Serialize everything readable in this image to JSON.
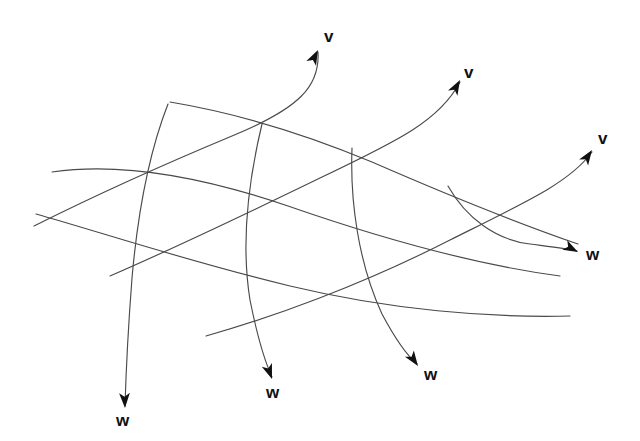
{
  "figure": {
    "width": 640,
    "height": 441,
    "background_color": "#ffffff",
    "line_color": "#4a4a4a",
    "arrow_color": "#111111",
    "label_color": "#111111"
  },
  "labels": {
    "v1": "v",
    "v2": "v",
    "v3": "v",
    "w1": "w",
    "w2": "w",
    "w3": "w",
    "w4": "w"
  },
  "label_positions": [
    {
      "text": "v",
      "x": 324,
      "y": 28
    },
    {
      "text": "v",
      "x": 464,
      "y": 64
    },
    {
      "text": "v",
      "x": 598,
      "y": 130
    },
    {
      "text": "w",
      "x": 116,
      "y": 412
    },
    {
      "text": "w",
      "x": 266,
      "y": 384
    },
    {
      "text": "w",
      "x": 424,
      "y": 366
    },
    {
      "text": "w",
      "x": 586,
      "y": 246
    }
  ],
  "curves": {
    "v_family": [
      "M 34,226 C 90,198 160,166 232,136 C 300,108 320,86 318,52",
      "M 110,276 C 170,250 250,212 320,178 C 400,140 440,120 460,82",
      "M 206,336 C 270,318 360,286 450,240 C 530,200 570,182 592,152"
    ],
    "w_family": [
      "M 168,104 C 150,150 138,210 132,278 C 128,330 126,372 125,406",
      "M 262,124 C 250,174 240,238 250,300 C 258,340 266,364 272,377",
      "M 352,148 C 350,200 358,262 382,314 C 398,344 410,358 417,364",
      "M 448,186 C 466,218 496,240 530,244 C 552,247 568,249 577,251"
    ],
    "u_family": [
      "M 170,102 C 230,112 300,132 372,162 C 450,196 520,224 578,244",
      "M 52,172 C 120,162 200,176 288,206 C 380,238 470,264 560,276",
      "M 36,214 C 100,232 190,262 290,286 C 390,310 490,318 570,316"
    ]
  },
  "arrow_heads": [
    {
      "name": "v-arrow-1",
      "tip_x": 318,
      "tip_y": 50,
      "angle": -63
    },
    {
      "name": "v-arrow-2",
      "tip_x": 460,
      "tip_y": 80,
      "angle": -61
    },
    {
      "name": "v-arrow-3",
      "tip_x": 592,
      "tip_y": 150,
      "angle": -56
    },
    {
      "name": "w-arrow-1",
      "tip_x": 125,
      "tip_y": 408,
      "angle": 88
    },
    {
      "name": "w-arrow-2",
      "tip_x": 272,
      "tip_y": 379,
      "angle": 70
    },
    {
      "name": "w-arrow-3",
      "tip_x": 418,
      "tip_y": 366,
      "angle": 55
    },
    {
      "name": "w-arrow-4",
      "tip_x": 578,
      "tip_y": 252,
      "angle": 28
    }
  ]
}
